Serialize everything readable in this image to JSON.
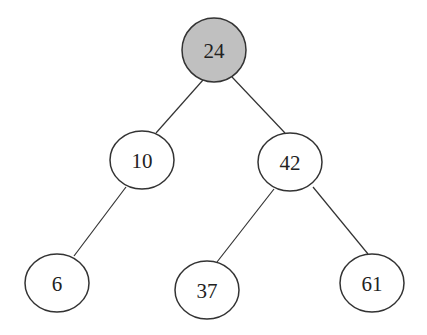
{
  "diagram": {
    "type": "binary-search-tree",
    "nodes": [
      {
        "id": "n24",
        "label": "24",
        "cx": 214,
        "cy": 50,
        "rx": 32,
        "ry": 32,
        "fill": "#c0c0c0",
        "highlighted": true
      },
      {
        "id": "n10",
        "label": "10",
        "cx": 142,
        "cy": 160,
        "rx": 32,
        "ry": 29,
        "fill": "#ffffff"
      },
      {
        "id": "n42",
        "label": "42",
        "cx": 290,
        "cy": 162,
        "rx": 32,
        "ry": 29,
        "fill": "#ffffff"
      },
      {
        "id": "n6",
        "label": "6",
        "cx": 57,
        "cy": 283,
        "rx": 32,
        "ry": 29,
        "fill": "#ffffff"
      },
      {
        "id": "n37",
        "label": "37",
        "cx": 207,
        "cy": 290,
        "rx": 32,
        "ry": 29,
        "fill": "#ffffff"
      },
      {
        "id": "n61",
        "label": "61",
        "cx": 372,
        "cy": 283,
        "rx": 32,
        "ry": 29,
        "fill": "#ffffff"
      }
    ],
    "edges": [
      {
        "from": "n24",
        "to": "n10",
        "x1": 203,
        "y1": 80,
        "x2": 156,
        "y2": 133
      },
      {
        "from": "n24",
        "to": "n42",
        "x1": 232,
        "y1": 77,
        "x2": 285,
        "y2": 133
      },
      {
        "from": "n10",
        "to": "n6",
        "x1": 126,
        "y1": 187,
        "x2": 74,
        "y2": 256
      },
      {
        "from": "n42",
        "to": "n37",
        "x1": 274,
        "y1": 189,
        "x2": 217,
        "y2": 262
      },
      {
        "from": "n42",
        "to": "n61",
        "x1": 313,
        "y1": 187,
        "x2": 368,
        "y2": 254
      }
    ]
  }
}
